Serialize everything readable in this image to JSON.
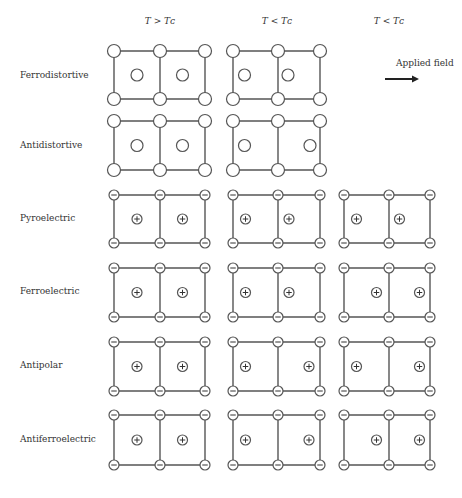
{
  "headers": [
    {
      "label": "T > Tᴄ",
      "x": 120
    },
    {
      "label": "T < Tᴄ",
      "x": 237
    },
    {
      "label": "T < Tᴄ",
      "x": 349
    }
  ],
  "field": {
    "label": "Applied field",
    "arrow": "right-arrow"
  },
  "colors": {
    "stroke": "#555555",
    "text": "#333333",
    "background": "#ffffff"
  },
  "rows": [
    {
      "label": "Ferrodistortive",
      "y0": 51,
      "y1": 99,
      "charged": false,
      "cells": [
        {
          "col": 0,
          "inner": [
            0,
            0
          ]
        },
        {
          "col": 1,
          "inner": [
            -1,
            -1
          ]
        }
      ]
    },
    {
      "label": "Antidistortive",
      "y0": 121,
      "y1": 170,
      "charged": false,
      "cells": [
        {
          "col": 0,
          "inner": [
            0,
            0
          ]
        },
        {
          "col": 1,
          "inner": [
            -1,
            1
          ]
        }
      ]
    },
    {
      "label": "Pyroelectric",
      "y0": 195,
      "y1": 243,
      "charged": true,
      "cells": [
        {
          "col": 0,
          "inner": [
            0,
            0
          ]
        },
        {
          "col": 1,
          "inner": [
            -1,
            -1
          ]
        },
        {
          "col": 2,
          "inner": [
            -1,
            -1
          ]
        }
      ]
    },
    {
      "label": "Ferroelectric",
      "y0": 268,
      "y1": 317,
      "charged": true,
      "cells": [
        {
          "col": 0,
          "inner": [
            0,
            0
          ]
        },
        {
          "col": 1,
          "inner": [
            -1,
            -1
          ]
        },
        {
          "col": 2,
          "inner": [
            1,
            1
          ]
        }
      ]
    },
    {
      "label": "Antipolar",
      "y0": 342,
      "y1": 391,
      "charged": true,
      "cells": [
        {
          "col": 0,
          "inner": [
            0,
            0
          ]
        },
        {
          "col": 1,
          "inner": [
            -1,
            1
          ]
        },
        {
          "col": 2,
          "inner": [
            -1,
            1
          ]
        }
      ]
    },
    {
      "label": "Antiferroelectric",
      "y0": 415,
      "y1": 465,
      "charged": true,
      "cells": [
        {
          "col": 0,
          "inner": [
            0,
            0
          ]
        },
        {
          "col": 1,
          "inner": [
            -1,
            1
          ]
        },
        {
          "col": 2,
          "inner": [
            1,
            1
          ]
        }
      ]
    }
  ],
  "columns": [
    {
      "x": [
        114,
        160,
        205
      ]
    },
    {
      "x": [
        233,
        278,
        320
      ]
    },
    {
      "x": [
        344,
        389,
        430
      ]
    }
  ]
}
